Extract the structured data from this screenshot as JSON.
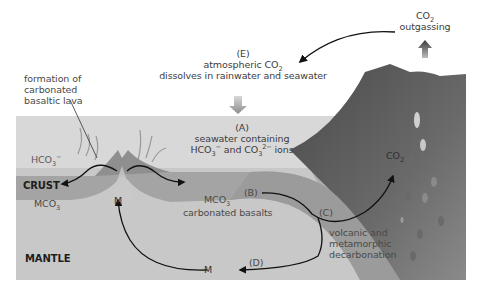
{
  "diagram": {
    "type": "carbonate-silicate cycle cross-section",
    "colors": {
      "sky": "#ffffff",
      "seawater": "#d6d6d6",
      "crust": "#a3a3a3",
      "mantle": "#c6c6c6",
      "subducting_slab": "#9a9a9a",
      "volcano": "#5e5e5e",
      "arrow": "#111111"
    },
    "labels": {
      "lava_line1": "formation of",
      "lava_line2": "carbonated",
      "lava_line3": "basaltic lava",
      "e_marker": "(E)",
      "e_line1_pre": "atmospheric CO",
      "e_line1_sub": "2",
      "e_line2": "dissolves in rainwater and seawater",
      "outgas_pre": "CO",
      "outgas_sub": "2",
      "outgas_line2": "outgassing",
      "a_marker": "(A)",
      "a_line1": "seawater containing",
      "a_hco3_pre": "HCO",
      "a_hco3_sub": "3",
      "a_hco3_sup": "−",
      "a_and": " and CO",
      "a_co3_sub": "3",
      "a_co3_sup": "2−",
      "a_ions": " ions",
      "hco3_left_pre": "HCO",
      "hco3_left_sub": "3",
      "hco3_left_sup": "−",
      "crust": "CRUST",
      "mantle": "MANTLE",
      "mco3_left_pre": "MCO",
      "mco3_left_sub": "3",
      "m_ridge": "M",
      "mco3_right_pre": "MCO",
      "mco3_right_sub": "3",
      "b_marker": "(B)",
      "carbonated_basalts": "carbonated basalts",
      "c_marker": "(C)",
      "c_line1": "volcanic and",
      "c_line2": "metamorphic",
      "c_line3": "decarbonation",
      "co2_volcano_pre": "CO",
      "co2_volcano_sub": "2",
      "d_marker": "(D)",
      "m_mantle": "M"
    }
  }
}
